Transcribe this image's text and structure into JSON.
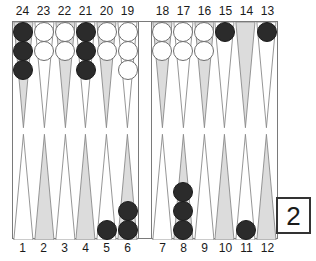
{
  "board": {
    "top_numbers_left": [
      "24",
      "23",
      "22",
      "21",
      "20",
      "19"
    ],
    "top_numbers_right": [
      "18",
      "17",
      "16",
      "15",
      "14",
      "13"
    ],
    "bottom_numbers_left": [
      "1",
      "2",
      "3",
      "4",
      "5",
      "6"
    ],
    "bottom_numbers_right": [
      "7",
      "8",
      "9",
      "10",
      "11",
      "12"
    ],
    "colors": {
      "black_checker": "#2b2b2b",
      "white_checker": "#ffffff",
      "point_shaded": "#dcdcdc",
      "point_plain": "#ffffff",
      "point_outline": "#8a8a8a",
      "frame_line": "#7a7a7a",
      "label_text": "#1a1a1a"
    },
    "points": [
      {
        "number": "24",
        "quadrant": "top-left",
        "slot": 0,
        "shaded": true,
        "checkers": 3,
        "color": "black"
      },
      {
        "number": "23",
        "quadrant": "top-left",
        "slot": 1,
        "shaded": false,
        "checkers": 2,
        "color": "white"
      },
      {
        "number": "22",
        "quadrant": "top-left",
        "slot": 2,
        "shaded": true,
        "checkers": 2,
        "color": "white"
      },
      {
        "number": "21",
        "quadrant": "top-left",
        "slot": 3,
        "shaded": false,
        "checkers": 3,
        "color": "black"
      },
      {
        "number": "20",
        "quadrant": "top-left",
        "slot": 4,
        "shaded": true,
        "checkers": 2,
        "color": "white"
      },
      {
        "number": "19",
        "quadrant": "top-left",
        "slot": 5,
        "shaded": false,
        "checkers": 3,
        "color": "white"
      },
      {
        "number": "18",
        "quadrant": "top-right",
        "slot": 0,
        "shaded": true,
        "checkers": 2,
        "color": "white"
      },
      {
        "number": "17",
        "quadrant": "top-right",
        "slot": 1,
        "shaded": false,
        "checkers": 2,
        "color": "white"
      },
      {
        "number": "16",
        "quadrant": "top-right",
        "slot": 2,
        "shaded": true,
        "checkers": 2,
        "color": "white"
      },
      {
        "number": "15",
        "quadrant": "top-right",
        "slot": 3,
        "shaded": false,
        "checkers": 1,
        "color": "black"
      },
      {
        "number": "14",
        "quadrant": "top-right",
        "slot": 4,
        "shaded": true,
        "checkers": 0,
        "color": "none"
      },
      {
        "number": "13",
        "quadrant": "top-right",
        "slot": 5,
        "shaded": false,
        "checkers": 1,
        "color": "black"
      },
      {
        "number": "1",
        "quadrant": "bottom-left",
        "slot": 0,
        "shaded": false,
        "checkers": 0,
        "color": "none"
      },
      {
        "number": "2",
        "quadrant": "bottom-left",
        "slot": 1,
        "shaded": true,
        "checkers": 0,
        "color": "none"
      },
      {
        "number": "3",
        "quadrant": "bottom-left",
        "slot": 2,
        "shaded": false,
        "checkers": 0,
        "color": "none"
      },
      {
        "number": "4",
        "quadrant": "bottom-left",
        "slot": 3,
        "shaded": true,
        "checkers": 0,
        "color": "none"
      },
      {
        "number": "5",
        "quadrant": "bottom-left",
        "slot": 4,
        "shaded": false,
        "checkers": 1,
        "color": "black"
      },
      {
        "number": "6",
        "quadrant": "bottom-left",
        "slot": 5,
        "shaded": true,
        "checkers": 2,
        "color": "black"
      },
      {
        "number": "7",
        "quadrant": "bottom-right",
        "slot": 0,
        "shaded": false,
        "checkers": 0,
        "color": "none"
      },
      {
        "number": "8",
        "quadrant": "bottom-right",
        "slot": 1,
        "shaded": true,
        "checkers": 3,
        "color": "black"
      },
      {
        "number": "9",
        "quadrant": "bottom-right",
        "slot": 2,
        "shaded": false,
        "checkers": 0,
        "color": "none"
      },
      {
        "number": "10",
        "quadrant": "bottom-right",
        "slot": 3,
        "shaded": true,
        "checkers": 0,
        "color": "none"
      },
      {
        "number": "11",
        "quadrant": "bottom-right",
        "slot": 4,
        "shaded": false,
        "checkers": 1,
        "color": "black"
      },
      {
        "number": "12",
        "quadrant": "bottom-right",
        "slot": 5,
        "shaded": true,
        "checkers": 0,
        "color": "none"
      }
    ]
  },
  "doubling_cube": {
    "value": "2"
  }
}
